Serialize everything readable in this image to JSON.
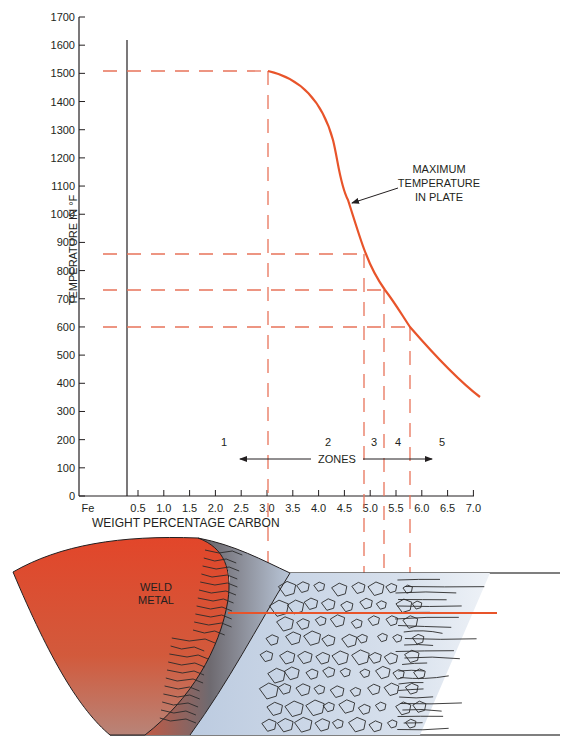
{
  "chart_data": {
    "type": "line",
    "title": "",
    "ylabel": "TEMPERATURE IN °F",
    "xlabel": "WEIGHT PERCENTAGE CARBON",
    "ylim": [
      0,
      1700
    ],
    "xlim": [
      0,
      7.0
    ],
    "y_ticks": [
      "0",
      "100",
      "200",
      "300",
      "400",
      "500",
      "600",
      "700",
      "800",
      "900",
      "1000",
      "1100",
      "1200",
      "1300",
      "1400",
      "1500",
      "1600",
      "1700"
    ],
    "x_ticks": [
      "Fe",
      "0.5",
      "1.0",
      "1.5",
      "2.0",
      "2.5",
      "3.0",
      "3.5",
      "4.0",
      "4.5",
      "5.0",
      "5.5",
      "6.0",
      "6.5",
      "7.0"
    ],
    "grid": false,
    "series": [
      {
        "name": "MAXIMUM TEMPERATURE IN PLATE",
        "color": "#e8542a",
        "x": [
          3.0,
          3.5,
          4.0,
          4.3,
          4.5,
          4.8,
          5.0,
          5.5,
          6.0,
          6.5,
          7.0
        ],
        "y": [
          1500,
          1440,
          1330,
          1220,
          1020,
          900,
          830,
          720,
          600,
          480,
          350
        ]
      }
    ],
    "reference_lines": {
      "horizontal_dashed_temperatures": [
        1500,
        860,
        735,
        600
      ],
      "vertical_dashed_carbon": [
        3.0,
        4.95,
        5.35,
        5.85
      ]
    },
    "annotations": [
      {
        "text": "MAXIMUM TEMPERATURE IN PLATE",
        "type": "arrow-label"
      },
      {
        "text": "ZONES",
        "type": "double-arrow"
      }
    ],
    "zones": [
      "1",
      "2",
      "3",
      "4",
      "5"
    ]
  },
  "labels": {
    "y_axis_title": "TEMPERATURE IN °F",
    "x_axis_title": "WEIGHT PERCENTAGE CARBON",
    "curve_label_line1": "MAXIMUM",
    "curve_label_line2": "TEMPERATURE",
    "curve_label_line3": "IN PLATE",
    "zones_label": "ZONES",
    "zone_1": "1",
    "zone_2": "2",
    "zone_3": "3",
    "zone_4": "4",
    "zone_5": "5",
    "weld_line1": "WELD",
    "weld_line2": "METAL"
  },
  "colors": {
    "curve": "#e8542a",
    "dashed": "#e8735a",
    "axis": "#231f20",
    "weld_top": "#e2462a",
    "weld_bottom": "#c07060",
    "haz_gray": "#7a7a80",
    "base_blue": "#c6d4e6"
  }
}
